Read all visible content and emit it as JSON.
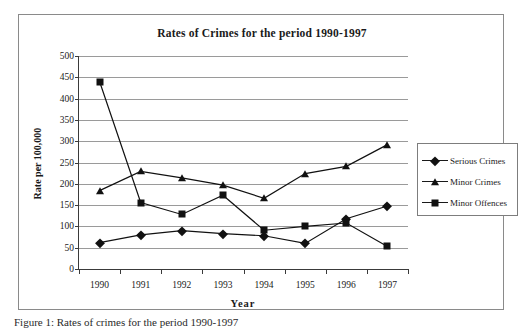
{
  "chart_data": {
    "type": "line",
    "title": "Rates of Crimes for the period 1990-1997",
    "xlabel": "Year",
    "ylabel": "Rate per 100,000",
    "categories": [
      "1990",
      "1991",
      "1992",
      "1993",
      "1994",
      "1995",
      "1996",
      "1997"
    ],
    "ylim": [
      0,
      500
    ],
    "ytick_step": 50,
    "yticks": [
      "500",
      "450",
      "400",
      "350",
      "300",
      "250",
      "200",
      "150",
      "100",
      "50",
      "0"
    ],
    "grid": true,
    "legend_position": "right",
    "series": [
      {
        "name": "Serious Crimes",
        "marker": "diamond",
        "values": [
          62,
          80,
          90,
          83,
          78,
          60,
          118,
          148
        ]
      },
      {
        "name": "Minor Crimes",
        "marker": "triangle",
        "values": [
          184,
          229,
          214,
          197,
          166,
          224,
          241,
          292
        ]
      },
      {
        "name": "Minor Offences",
        "marker": "square",
        "values": [
          440,
          156,
          128,
          173,
          91,
          100,
          108,
          53
        ]
      }
    ]
  },
  "caption": "Figure 1: Rates of crimes for the period 1990-1997"
}
